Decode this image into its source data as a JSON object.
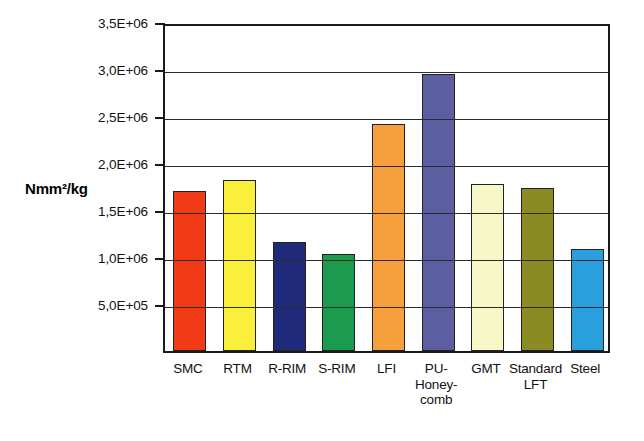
{
  "chart_data": {
    "type": "bar",
    "title": "",
    "xlabel": "",
    "ylabel": "Nmm²/kg",
    "ylim": [
      0,
      3500000
    ],
    "grid": true,
    "legend": "none",
    "categories": [
      "SMC",
      "RTM",
      "R-RIM",
      "S-RIM",
      "LFI",
      "PU-Honey-comb",
      "GMT",
      "Standard LFT",
      "Steel"
    ],
    "category_lines": [
      [
        "SMC"
      ],
      [
        "RTM"
      ],
      [
        "R-RIM"
      ],
      [
        "S-RIM"
      ],
      [
        "LFI"
      ],
      [
        "PU-",
        "Honey-",
        "comb"
      ],
      [
        "GMT"
      ],
      [
        "Standard",
        "LFT"
      ],
      [
        "Steel"
      ]
    ],
    "values": [
      1700000,
      1820000,
      1160000,
      1030000,
      2410000,
      2950000,
      1780000,
      1730000,
      1090000
    ],
    "colors": [
      "#F03B16",
      "#FAF03C",
      "#1F2A7A",
      "#1C9A4E",
      "#F5A03C",
      "#5B5EA0",
      "#F7F7C8",
      "#8A8B22",
      "#2A9FDE"
    ],
    "ytick_values": [
      500000,
      1000000,
      1500000,
      2000000,
      2500000,
      3000000,
      3500000
    ],
    "ytick_labels": [
      "5,0E+05",
      "1,0E+06",
      "1,5E+06",
      "2,0E+06",
      "2,5E+06",
      "3,0E+06",
      "3,5E+06"
    ]
  }
}
